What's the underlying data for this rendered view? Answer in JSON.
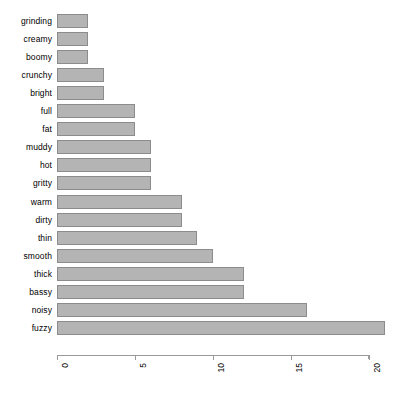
{
  "chart_data": {
    "type": "bar",
    "orientation": "horizontal",
    "title": "",
    "xlabel": "",
    "ylabel": "",
    "grid": false,
    "legend": null,
    "xlim": [
      0,
      21
    ],
    "xticks": [
      0,
      5,
      10,
      15,
      20
    ],
    "xtick_labels": [
      "0",
      "5",
      "10",
      "15",
      "20"
    ],
    "xtick_label_rotation": -90,
    "bar_color": "#b4b4b4",
    "bar_border_color": "#8c8c8c",
    "background": "#ffffff",
    "categories": [
      "grinding",
      "creamy",
      "boomy",
      "crunchy",
      "bright",
      "full",
      "fat",
      "muddy",
      "hot",
      "gritty",
      "warm",
      "dirty",
      "thin",
      "smooth",
      "thick",
      "bassy",
      "noisy",
      "fuzzy"
    ],
    "values": [
      2,
      2,
      2,
      3,
      3,
      5,
      5,
      6,
      6,
      6,
      8,
      8,
      9,
      10,
      12,
      12,
      16,
      21
    ]
  },
  "caption": {
    "fragment": ""
  }
}
